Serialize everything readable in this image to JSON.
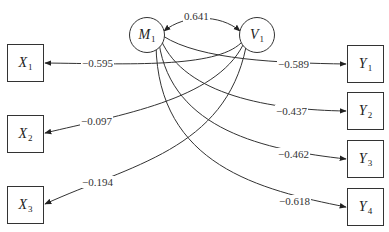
{
  "diagram": {
    "type": "path-model",
    "latent_nodes": [
      {
        "id": "M1",
        "letter": "M",
        "sub": "1"
      },
      {
        "id": "V1",
        "letter": "V",
        "sub": "1"
      }
    ],
    "left_nodes": [
      {
        "id": "X1",
        "letter": "X",
        "sub": "1"
      },
      {
        "id": "X2",
        "letter": "X",
        "sub": "2"
      },
      {
        "id": "X3",
        "letter": "X",
        "sub": "3"
      }
    ],
    "right_nodes": [
      {
        "id": "Y1",
        "letter": "Y",
        "sub": "1"
      },
      {
        "id": "Y2",
        "letter": "Y",
        "sub": "2"
      },
      {
        "id": "Y3",
        "letter": "Y",
        "sub": "3"
      },
      {
        "id": "Y4",
        "letter": "Y",
        "sub": "4"
      }
    ],
    "correlation": {
      "from": "M1",
      "to": "V1",
      "label": "0.641"
    },
    "edges": [
      {
        "from": "V1",
        "to": "X1",
        "label": "−0.595"
      },
      {
        "from": "V1",
        "to": "X2",
        "label": "−0.097"
      },
      {
        "from": "V1",
        "to": "X3",
        "label": "−0.194"
      },
      {
        "from": "M1",
        "to": "Y1",
        "label": "−0.589"
      },
      {
        "from": "M1",
        "to": "Y2",
        "label": "−0.437"
      },
      {
        "from": "M1",
        "to": "Y3",
        "label": "−0.462"
      },
      {
        "from": "M1",
        "to": "Y4",
        "label": "−0.618"
      }
    ],
    "line_color": "#333333"
  }
}
